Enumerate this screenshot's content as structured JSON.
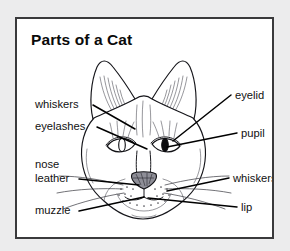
{
  "page": {
    "background_color": "#ececed",
    "frame_color": "#3a3a3c",
    "canvas_color": "#ffffff"
  },
  "diagram": {
    "title": "Parts of a Cat",
    "labels": [
      {
        "id": "whiskers-left",
        "text": "whiskers",
        "side": "left",
        "x": 18,
        "y": 88
      },
      {
        "id": "eyelashes",
        "text": "eyelashes",
        "side": "left",
        "x": 18,
        "y": 110
      },
      {
        "id": "nose-leather-1",
        "text": "nose",
        "side": "left",
        "x": 18,
        "y": 148
      },
      {
        "id": "nose-leather-2",
        "text": "leather",
        "side": "left",
        "x": 18,
        "y": 162
      },
      {
        "id": "muzzle",
        "text": "muzzle",
        "side": "left",
        "x": 18,
        "y": 194
      },
      {
        "id": "eyelid",
        "text": "eyelid",
        "side": "right",
        "x": 218,
        "y": 80
      },
      {
        "id": "pupil",
        "text": "pupil",
        "side": "right",
        "x": 224,
        "y": 119
      },
      {
        "id": "whiskers-right",
        "text": "whiskers",
        "side": "right",
        "x": 216,
        "y": 163
      },
      {
        "id": "lip",
        "text": "lip",
        "side": "right",
        "x": 224,
        "y": 192
      }
    ],
    "anatomy_parts": [
      "ear",
      "eyelid",
      "eyelashes",
      "pupil",
      "nose leather",
      "whiskers",
      "muzzle",
      "lip"
    ],
    "colors": {
      "ink": "#15151a",
      "fur_shading": "#56565e",
      "nose_fill": "#8e8e97",
      "pupil_fill": "#0b0b0e",
      "leader_line": "#000000"
    }
  }
}
